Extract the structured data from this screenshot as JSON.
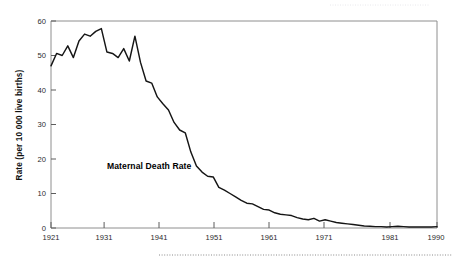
{
  "chart_data": {
    "type": "line",
    "title": "",
    "subtitle": "",
    "xlabel": "",
    "ylabel": "Rate (per 10 000 live births)",
    "xlim": [
      1921,
      1990
    ],
    "ylim": [
      0,
      60
    ],
    "grid": false,
    "legend_position": "none",
    "annotations": [
      {
        "text": "Maternal Death Rate",
        "x": 1931,
        "y": 17,
        "bold": true
      }
    ],
    "x_ticks": [
      1921,
      1931,
      1941,
      1951,
      1961,
      1971,
      1981,
      1990
    ],
    "x_tick_labels": [
      "1921",
      "1931",
      "1941",
      "1951",
      "1961",
      "1971",
      "1981",
      "1990"
    ],
    "y_ticks": [
      0,
      10,
      20,
      30,
      40,
      50,
      60
    ],
    "y_tick_labels": [
      "0",
      "10",
      "20",
      "30",
      "40",
      "50",
      "60"
    ],
    "series": [
      {
        "name": "Maternal Death Rate",
        "color": "#151515",
        "x": [
          1921,
          1922,
          1923,
          1924,
          1925,
          1926,
          1927,
          1928,
          1929,
          1930,
          1931,
          1932,
          1933,
          1934,
          1935,
          1936,
          1937,
          1938,
          1939,
          1940,
          1941,
          1942,
          1943,
          1944,
          1945,
          1946,
          1947,
          1948,
          1949,
          1950,
          1951,
          1952,
          1953,
          1954,
          1955,
          1956,
          1957,
          1958,
          1959,
          1960,
          1961,
          1962,
          1963,
          1964,
          1965,
          1966,
          1967,
          1968,
          1969,
          1970,
          1971,
          1972,
          1973,
          1974,
          1975,
          1976,
          1977,
          1978,
          1979,
          1980,
          1981,
          1982,
          1983,
          1984,
          1985,
          1986,
          1987,
          1988,
          1989,
          1990
        ],
        "values": [
          47.0,
          50.6,
          50.0,
          52.8,
          49.4,
          54.2,
          56.2,
          55.6,
          57.0,
          57.8,
          51.0,
          50.6,
          49.4,
          52.0,
          48.4,
          55.6,
          48.0,
          42.6,
          42.0,
          38.0,
          36.0,
          34.2,
          30.6,
          28.4,
          27.6,
          22.0,
          18.0,
          16.2,
          15.0,
          14.8,
          11.8,
          11.0,
          10.0,
          9.0,
          8.0,
          7.2,
          7.0,
          6.2,
          5.4,
          5.2,
          4.4,
          4.0,
          3.8,
          3.6,
          3.0,
          2.6,
          2.4,
          2.8,
          2.0,
          2.4,
          2.0,
          1.6,
          1.4,
          1.2,
          1.0,
          0.8,
          0.6,
          0.5,
          0.4,
          0.4,
          0.3,
          0.4,
          0.5,
          0.4,
          0.3,
          0.3,
          0.3,
          0.3,
          0.3,
          0.4
        ]
      }
    ]
  },
  "figure": {
    "y_axis_title": "Rate (per 10 000 live births)",
    "annotation_label": "Maternal Death Rate",
    "frame_color": "#8e8e8e",
    "line_color": "#151515",
    "background_color": "#ffffff"
  }
}
